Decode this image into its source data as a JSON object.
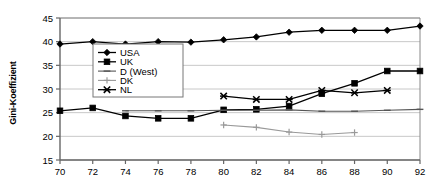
{
  "chart_data": {
    "type": "line",
    "title": "",
    "xlabel": "",
    "ylabel": "Gini-Koeffizient",
    "xlim": [
      70,
      92
    ],
    "ylim": [
      15,
      45
    ],
    "xticks": [
      70,
      72,
      74,
      76,
      78,
      80,
      82,
      84,
      86,
      88,
      90,
      92
    ],
    "yticks": [
      15,
      20,
      25,
      30,
      35,
      40,
      45
    ],
    "grid": true,
    "legend_position": "inside-upper-left",
    "series": [
      {
        "name": "USA",
        "marker": "diamond",
        "color": "#000000",
        "x": [
          70,
          72,
          74,
          76,
          78,
          80,
          82,
          84,
          86,
          88,
          90,
          92
        ],
        "values": [
          39.5,
          40.0,
          39.5,
          40.0,
          39.9,
          40.4,
          41.0,
          42.0,
          42.4,
          42.4,
          42.4,
          43.3
        ]
      },
      {
        "name": "UK",
        "marker": "square",
        "color": "#000000",
        "x": [
          70,
          72,
          74,
          76,
          78,
          80,
          82,
          84,
          86,
          88,
          90,
          92
        ],
        "values": [
          25.4,
          26.0,
          24.3,
          23.8,
          23.8,
          25.6,
          25.7,
          26.4,
          29.0,
          31.2,
          33.8,
          33.8
        ]
      },
      {
        "name": "D (West)",
        "marker": "dash",
        "color": "#555555",
        "x": [
          74,
          76,
          78,
          80,
          82,
          84,
          86,
          88,
          90,
          92
        ],
        "values": [
          25.4,
          25.4,
          25.4,
          25.5,
          25.5,
          25.6,
          25.3,
          25.3,
          25.5,
          25.7
        ]
      },
      {
        "name": "DK",
        "marker": "plus",
        "color": "#999999",
        "x": [
          80,
          82,
          84,
          86,
          88
        ],
        "values": [
          22.4,
          21.9,
          20.9,
          20.4,
          20.8
        ]
      },
      {
        "name": "NL",
        "marker": "asterisk",
        "color": "#000000",
        "x": [
          80,
          82,
          84,
          86,
          88,
          90
        ],
        "values": [
          28.5,
          27.8,
          27.8,
          29.7,
          29.2,
          29.7
        ]
      }
    ]
  },
  "legend": {
    "entries": [
      {
        "label": "USA"
      },
      {
        "label": "UK"
      },
      {
        "label": "D (West)"
      },
      {
        "label": "DK"
      },
      {
        "label": "NL"
      }
    ]
  },
  "axes": {
    "y_title": "Gini-Koeffizient"
  },
  "colors": {
    "axis": "#666666",
    "grid": "#c8c8c8",
    "plot_bg": "#ffffff",
    "usa": "#000000",
    "uk": "#000000",
    "dwest": "#555555",
    "dk": "#999999",
    "nl": "#000000"
  }
}
